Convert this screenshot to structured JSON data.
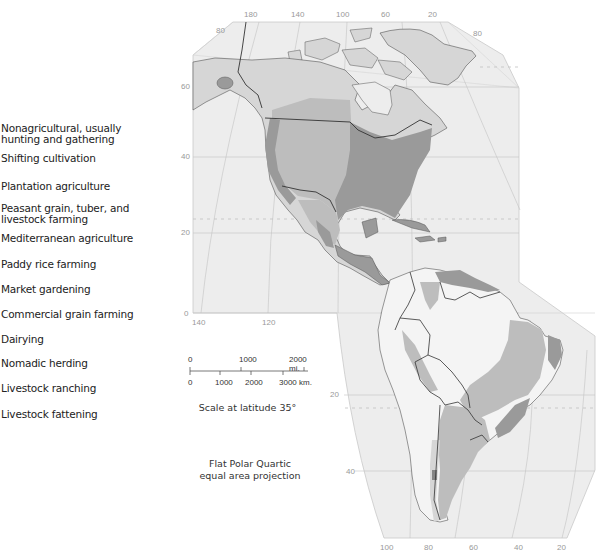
{
  "legend": {
    "items": [
      {
        "label": "Nonagricultural, usually\nhunting and gathering"
      },
      {
        "label": "Shifting cultivation"
      },
      {
        "label": "Plantation agriculture"
      },
      {
        "label": "Peasant grain, tuber, and\nlivestock farming"
      },
      {
        "label": "Mediterranean agriculture"
      },
      {
        "label": "Paddy rice farming"
      },
      {
        "label": "Market gardening"
      },
      {
        "label": "Commercial grain farming"
      },
      {
        "label": "Dairying"
      },
      {
        "label": "Nomadic herding"
      },
      {
        "label": "Livestock ranching"
      },
      {
        "label": "Livestock fattening"
      }
    ]
  },
  "map": {
    "top_longitudes": [
      "180",
      "140",
      "100",
      "60",
      "20"
    ],
    "top_latitude_left": "80",
    "top_latitude_right": "80",
    "left_latitudes": [
      "60",
      "40",
      "20",
      "0"
    ],
    "mid_longitudes": [
      "140",
      "120"
    ],
    "south_latitudes": [
      "20",
      "40"
    ],
    "bottom_longitudes": [
      "100",
      "80",
      "60",
      "40",
      "20"
    ],
    "colors": {
      "ocean": "#ededed",
      "land_light": "#d6d6d6",
      "land_medium": "#bdbdbd",
      "land_dark": "#9a9a9a",
      "land_darkest": "#858585",
      "land_white": "#f4f4f4",
      "border": "#333333",
      "grid": "#c2c2c2"
    }
  },
  "scale": {
    "mi_labels": [
      "0",
      "1000",
      "2000 mi."
    ],
    "km_labels": [
      "0",
      "1000",
      "2000",
      "3000 km."
    ],
    "caption": "Scale at latitude 35°"
  },
  "projection": {
    "line1": "Flat Polar Quartic",
    "line2": "equal area projection"
  }
}
